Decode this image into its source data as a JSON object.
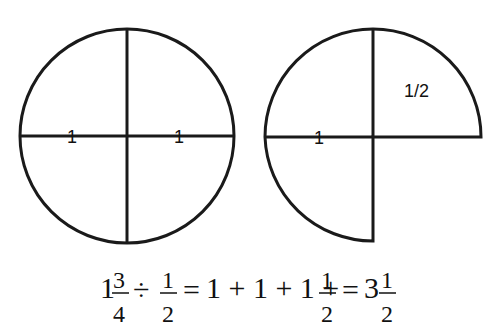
{
  "diagram": {
    "left_circle": {
      "description": "Whole circle divided into quarters",
      "labels": [
        "1",
        "1"
      ]
    },
    "right_shape": {
      "description": "Three quarters of a circle",
      "labels": [
        "1",
        "1/2"
      ]
    }
  },
  "equation": {
    "whole": "1",
    "frac1_num": "3",
    "frac1_den": "4",
    "div": "÷",
    "frac2_num": "1",
    "frac2_den": "2",
    "eq1": "=",
    "ones": "1 + 1 + 1 +",
    "frac3_num": "1",
    "frac3_den": "2",
    "eq2": "=",
    "result_whole": "3",
    "frac4_num": "1",
    "frac4_den": "2"
  }
}
